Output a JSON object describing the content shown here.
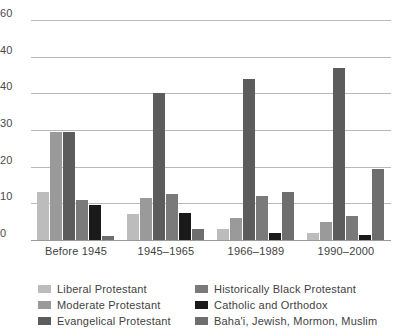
{
  "chart_data": {
    "type": "bar",
    "title": "",
    "subtitle": "",
    "xlabel": "",
    "ylabel": "",
    "ylim": [
      0,
      60
    ],
    "yticks": [
      0,
      10,
      20,
      30,
      40,
      40,
      60
    ],
    "ytick_labels": [
      "0",
      "10",
      "20",
      "30",
      "40",
      "40",
      "60"
    ],
    "grid": true,
    "legend_position": "bottom",
    "categories": [
      "Before 1945",
      "1945–1965",
      "1966–1989",
      "1990–2000"
    ],
    "series": [
      {
        "name": "Liberal Protestant",
        "color": "#bcbcbc",
        "values": [
          13,
          7,
          3,
          2
        ]
      },
      {
        "name": "Moderate Protestant",
        "color": "#9a9a9a",
        "values": [
          29.5,
          11.5,
          6,
          5
        ]
      },
      {
        "name": "Evangelical Protestant",
        "color": "#5c5c5c",
        "values": [
          29.5,
          40,
          44,
          47
        ]
      },
      {
        "name": "Historically Black Protestant",
        "color": "#7a7a7a",
        "values": [
          11,
          12.5,
          12,
          6.5
        ]
      },
      {
        "name": "Catholic and Orthodox",
        "color": "#1a1a1a",
        "values": [
          9.5,
          7.5,
          2,
          1.5
        ]
      },
      {
        "name": "Baha'i, Jewish, Mormon, Muslim",
        "color": "#6e6e6e",
        "values": [
          1,
          3,
          13,
          19.5
        ]
      }
    ]
  },
  "legend": {
    "items": [
      {
        "label": "Liberal Protestant"
      },
      {
        "label": "Historically Black Protestant"
      },
      {
        "label": "Moderate Protestant"
      },
      {
        "label": "Catholic and Orthodox"
      },
      {
        "label": "Evangelical Protestant"
      },
      {
        "label": "Baha'i, Jewish, Mormon, Muslim"
      }
    ]
  },
  "axis": {
    "ytick_labels": [
      "60",
      "40",
      "40",
      "30",
      "20",
      "10",
      "0"
    ]
  },
  "colors": {
    "gridline": "#b9b9b9",
    "text": "#3f3f3f",
    "background": "#ffffff"
  }
}
